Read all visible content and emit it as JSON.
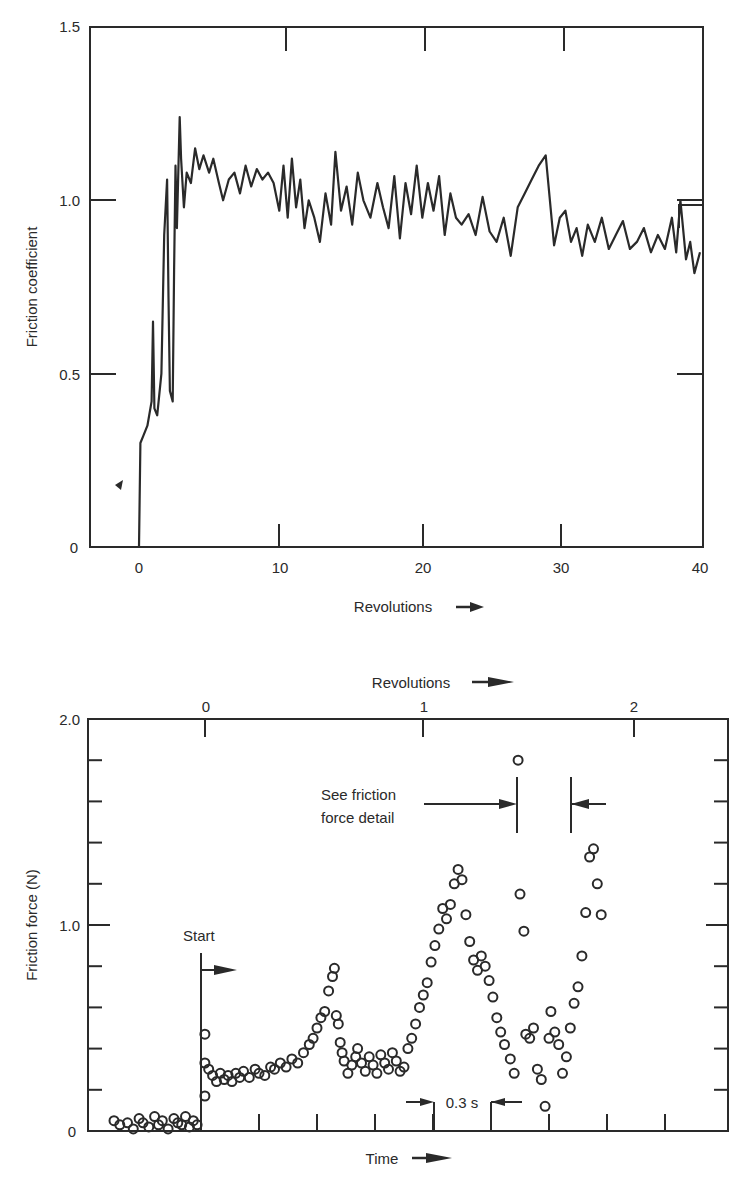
{
  "chart_data": [
    {
      "type": "line",
      "title": "",
      "xlabel": "Revolutions",
      "xlabel_arrow": "→",
      "ylabel": "Friction coefficient",
      "xlim": [
        -3.5,
        40
      ],
      "ylim": [
        0,
        1.5
      ],
      "x_ticks": [
        0,
        10,
        20,
        30,
        40
      ],
      "x_tick_labels": [
        "0",
        "10",
        "20",
        "30",
        "40"
      ],
      "y_ticks": [
        0,
        0.5,
        1.0,
        1.5
      ],
      "y_tick_labels": [
        "0",
        "0.5",
        "1.0",
        "1.5"
      ],
      "grid": false,
      "legend": null,
      "annotations": [
        {
          "type": "small-mark",
          "x": -1.3,
          "y": 0.18
        }
      ],
      "series": [
        {
          "name": "Friction coefficient",
          "x": [
            0,
            0.1,
            0.3,
            0.6,
            0.9,
            1.0,
            1.1,
            1.3,
            1.6,
            1.8,
            2.0,
            2.1,
            2.2,
            2.4,
            2.5,
            2.6,
            2.7,
            2.9,
            3.0,
            3.2,
            3.4,
            3.7,
            4.0,
            4.3,
            4.6,
            5.0,
            5.3,
            5.7,
            6.0,
            6.4,
            6.8,
            7.2,
            7.6,
            8.0,
            8.4,
            8.8,
            9.2,
            9.6,
            10.0,
            10.3,
            10.6,
            10.9,
            11.2,
            11.5,
            11.8,
            12.1,
            12.5,
            12.9,
            13.3,
            13.7,
            14.0,
            14.4,
            14.8,
            15.2,
            15.6,
            16.0,
            16.5,
            17.0,
            17.4,
            17.8,
            18.2,
            18.6,
            19.0,
            19.4,
            19.8,
            20.2,
            20.6,
            21.0,
            21.4,
            21.8,
            22.2,
            22.6,
            23.0,
            23.5,
            24.0,
            24.5,
            25.0,
            25.5,
            26.0,
            26.5,
            27.0,
            27.5,
            28.0,
            28.5,
            29.0,
            29.3,
            29.6,
            30.0,
            30.4,
            30.8,
            31.2,
            31.6,
            32.0,
            32.5,
            33.0,
            33.5,
            34.0,
            34.5,
            35.0,
            35.5,
            36.0,
            36.5,
            37.0,
            37.5,
            38.0,
            38.3,
            38.6,
            39.0,
            39.3,
            39.6,
            40.0
          ],
          "y": [
            0,
            0.3,
            0.32,
            0.35,
            0.42,
            0.65,
            0.4,
            0.38,
            0.5,
            0.9,
            1.06,
            0.72,
            0.45,
            0.42,
            0.8,
            1.1,
            0.92,
            1.24,
            1.12,
            0.98,
            1.08,
            1.05,
            1.15,
            1.09,
            1.13,
            1.08,
            1.12,
            1.05,
            1.0,
            1.06,
            1.08,
            1.02,
            1.1,
            1.04,
            1.09,
            1.06,
            1.08,
            1.05,
            0.97,
            1.1,
            0.95,
            1.12,
            0.98,
            1.06,
            0.92,
            1.0,
            0.95,
            0.88,
            1.02,
            0.93,
            1.14,
            0.97,
            1.04,
            0.93,
            1.08,
            1.0,
            0.95,
            1.05,
            0.98,
            0.92,
            1.07,
            0.89,
            1.05,
            0.96,
            1.1,
            0.95,
            1.05,
            0.97,
            1.07,
            0.9,
            1.02,
            0.95,
            0.93,
            0.96,
            0.9,
            1.01,
            0.91,
            0.88,
            0.95,
            0.84,
            0.98,
            1.02,
            1.06,
            1.1,
            1.13,
            1.0,
            0.87,
            0.95,
            0.97,
            0.88,
            0.92,
            0.84,
            0.93,
            0.88,
            0.95,
            0.86,
            0.9,
            0.94,
            0.86,
            0.88,
            0.92,
            0.85,
            0.9,
            0.86,
            0.95,
            0.85,
            1.0,
            0.83,
            0.88,
            0.79,
            0.85
          ]
        }
      ]
    },
    {
      "type": "scatter",
      "title": "",
      "xlabel": "Time",
      "xlabel_arrow": "→",
      "x2label": "Revolutions",
      "x2label_arrow": "→",
      "ylabel": "Friction force (N)",
      "xlim_time_s": [
        -1.2,
        2.1
      ],
      "ylim": [
        0,
        2.0
      ],
      "x2_ticks": [
        0,
        1,
        2
      ],
      "x2_tick_labels": [
        "0",
        "1",
        "2"
      ],
      "x_time_tick_spacing_s": 0.3,
      "y_major_ticks": [
        0,
        1.0,
        2.0
      ],
      "y_tick_labels": [
        "0",
        "1.0",
        "2.0"
      ],
      "y_minor_tick_spacing": 0.2,
      "grid": false,
      "legend": null,
      "marker": "open-circle",
      "annotations": [
        {
          "text": "Start",
          "type": "vertical-line-with-arrow",
          "x_time_s": 0.0,
          "y_top": 0.86
        },
        {
          "text_lines": [
            "See friction",
            "force detail"
          ],
          "type": "bracketed-interval",
          "x_start_time_s": 1.63,
          "x_end_time_s": 1.91
        },
        {
          "text": "0.3 s",
          "type": "interval-scale",
          "x_start_time_s": 1.2,
          "x_end_time_s": 1.5
        }
      ],
      "series": [
        {
          "name": "Friction force",
          "x_time_s": [
            -0.45,
            -0.42,
            -0.38,
            -0.35,
            -0.32,
            -0.3,
            -0.27,
            -0.24,
            -0.22,
            -0.2,
            -0.17,
            -0.14,
            -0.12,
            -0.1,
            -0.08,
            -0.06,
            -0.04,
            -0.02,
            0.02,
            0.02,
            0.02,
            0.04,
            0.06,
            0.08,
            0.1,
            0.12,
            0.14,
            0.16,
            0.18,
            0.2,
            0.22,
            0.25,
            0.28,
            0.3,
            0.33,
            0.36,
            0.38,
            0.41,
            0.44,
            0.47,
            0.5,
            0.53,
            0.56,
            0.58,
            0.6,
            0.62,
            0.64,
            0.66,
            0.68,
            0.69,
            0.7,
            0.71,
            0.72,
            0.73,
            0.74,
            0.76,
            0.78,
            0.8,
            0.81,
            0.83,
            0.85,
            0.87,
            0.89,
            0.91,
            0.93,
            0.95,
            0.97,
            0.99,
            1.01,
            1.03,
            1.05,
            1.07,
            1.09,
            1.11,
            1.13,
            1.15,
            1.17,
            1.19,
            1.21,
            1.23,
            1.25,
            1.27,
            1.29,
            1.31,
            1.33,
            1.35,
            1.37,
            1.39,
            1.41,
            1.43,
            1.45,
            1.47,
            1.49,
            1.51,
            1.53,
            1.55,
            1.57,
            1.6,
            1.62,
            1.64,
            1.65,
            1.67,
            1.68,
            1.7,
            1.72,
            1.74,
            1.76,
            1.78,
            1.8,
            1.81,
            1.83,
            1.85,
            1.87,
            1.89,
            1.91,
            1.93,
            1.95,
            1.97,
            1.99,
            2.01,
            2.03,
            2.05,
            2.07
          ],
          "y": [
            0.05,
            0.03,
            0.04,
            0.01,
            0.06,
            0.04,
            0.02,
            0.07,
            0.03,
            0.05,
            0.01,
            0.06,
            0.04,
            0.03,
            0.07,
            0.02,
            0.05,
            0.03,
            0.47,
            0.33,
            0.17,
            0.3,
            0.27,
            0.24,
            0.28,
            0.25,
            0.27,
            0.24,
            0.28,
            0.26,
            0.29,
            0.26,
            0.3,
            0.28,
            0.27,
            0.31,
            0.3,
            0.33,
            0.31,
            0.35,
            0.33,
            0.38,
            0.42,
            0.45,
            0.5,
            0.55,
            0.58,
            0.68,
            0.75,
            0.79,
            0.56,
            0.52,
            0.43,
            0.38,
            0.34,
            0.28,
            0.32,
            0.36,
            0.4,
            0.33,
            0.29,
            0.36,
            0.32,
            0.28,
            0.37,
            0.33,
            0.3,
            0.38,
            0.34,
            0.29,
            0.31,
            0.4,
            0.45,
            0.52,
            0.6,
            0.66,
            0.72,
            0.82,
            0.9,
            0.98,
            1.08,
            1.03,
            1.1,
            1.2,
            1.27,
            1.22,
            1.05,
            0.92,
            0.83,
            0.78,
            0.85,
            0.8,
            0.73,
            0.65,
            0.55,
            0.48,
            0.42,
            0.35,
            0.28,
            1.8,
            1.15,
            0.97,
            0.47,
            0.45,
            0.5,
            0.3,
            0.25,
            0.12,
            0.45,
            0.58,
            0.48,
            0.42,
            0.28,
            0.36,
            0.5,
            0.62,
            0.7,
            0.85,
            1.06,
            1.33,
            1.37,
            1.2,
            1.05
          ],
          "notes": "Approximate sample of open-circle markers; scatter grows very wide after ~1.5 s (values 0.1–1.8 N)."
        }
      ]
    }
  ],
  "top_chart": {
    "ylabel": "Friction coefficient",
    "xlabel": "Revolutions",
    "x_tick_labels": [
      "0",
      "10",
      "20",
      "30",
      "40"
    ],
    "y_tick_labels": [
      "0",
      "0.5",
      "1.0",
      "1.5"
    ]
  },
  "bottom_chart": {
    "ylabel": "Friction force (N)",
    "xlabel": "Time",
    "x2label": "Revolutions",
    "x2_tick_labels": [
      "0",
      "1",
      "2"
    ],
    "y_tick_labels": [
      "0",
      "1.0",
      "2.0"
    ],
    "start_label": "Start",
    "detail_label_line1": "See friction",
    "detail_label_line2": "force detail",
    "interval_label": "0.3 s"
  },
  "colors": {
    "ink": "#2a2a2a",
    "background": "#ffffff"
  }
}
